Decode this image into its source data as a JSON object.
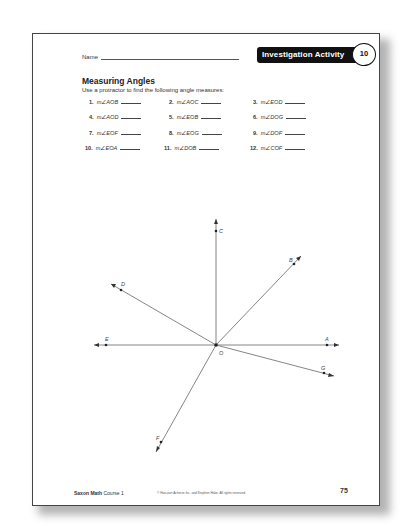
{
  "header": {
    "name_label": "Name",
    "badge_label": "Investigation Activity",
    "badge_number": "10"
  },
  "section": {
    "title": "Measuring Angles",
    "instruction": "Use a protractor to find the following angle measures:"
  },
  "questions": [
    {
      "num": "1.",
      "expr": "m∠AOB"
    },
    {
      "num": "2.",
      "expr": "m∠AOC"
    },
    {
      "num": "3.",
      "expr": "m∠EOD"
    },
    {
      "num": "4.",
      "expr": "m∠AOD"
    },
    {
      "num": "5.",
      "expr": "m∠EOB"
    },
    {
      "num": "6.",
      "expr": "m∠DOG"
    },
    {
      "num": "7.",
      "expr": "m∠EOF"
    },
    {
      "num": "8.",
      "expr": "m∠EOG"
    },
    {
      "num": "9.",
      "expr": "m∠DOF"
    },
    {
      "num": "10.",
      "expr": "m∠EOA"
    },
    {
      "num": "11.",
      "expr": "m∠DOB"
    },
    {
      "num": "12.",
      "expr": "m∠COF"
    }
  ],
  "diagram": {
    "vertex": "O",
    "points": [
      "A",
      "B",
      "C",
      "D",
      "E",
      "F",
      "G"
    ]
  },
  "footer": {
    "brand": "Saxon Math",
    "course": "Course 1",
    "copyright": "© Harcourt Achieve Inc. and Stephen Hake. All rights reserved.",
    "page_number": "75"
  }
}
